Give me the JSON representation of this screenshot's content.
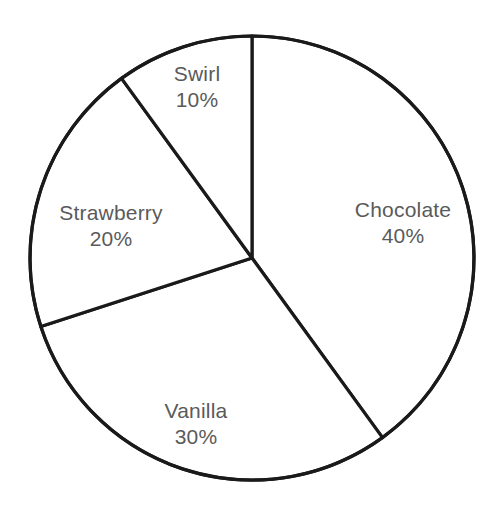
{
  "chart_data": {
    "type": "pie",
    "title": "",
    "subtitle": "",
    "xlabel": "",
    "ylabel": "",
    "legend": "none",
    "grid": false,
    "categories": [
      "Chocolate",
      "Vanilla",
      "Strawberry",
      "Swirl"
    ],
    "values": [
      40,
      30,
      20,
      10
    ],
    "value_unit": "%",
    "labels_inside": true,
    "start_angle_deg": 0,
    "direction": "clockwise",
    "slices": [
      {
        "name": "Chocolate",
        "value": 40,
        "value_label": "40%",
        "start_deg": 0,
        "end_deg": 144,
        "fill": "#ffffff",
        "stroke": "#1a1a1a",
        "label_x": 403,
        "label_y": 223
      },
      {
        "name": "Vanilla",
        "value": 30,
        "value_label": "30%",
        "start_deg": 144,
        "end_deg": 252,
        "fill": "#ffffff",
        "stroke": "#1a1a1a",
        "label_x": 196,
        "label_y": 424
      },
      {
        "name": "Strawberry",
        "value": 20,
        "value_label": "20%",
        "start_deg": 252,
        "end_deg": 324,
        "fill": "#ffffff",
        "stroke": "#1a1a1a",
        "label_x": 111,
        "label_y": 226
      },
      {
        "name": "Swirl",
        "value": 10,
        "value_label": "10%",
        "start_deg": 324,
        "end_deg": 360,
        "fill": "#ffffff",
        "stroke": "#1a1a1a",
        "label_x": 197,
        "label_y": 87
      }
    ],
    "geometry": {
      "center_x": 252,
      "center_y": 258,
      "radius": 222,
      "stroke_width": 3.2
    },
    "colors": {
      "background": "#ffffff",
      "slice_fill": "#ffffff",
      "outline": "#1a1a1a",
      "label_text": "#5a5a5a"
    }
  }
}
